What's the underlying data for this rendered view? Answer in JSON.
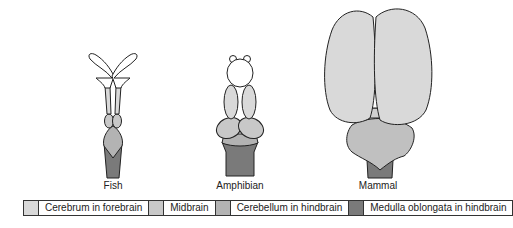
{
  "colors": {
    "cerebrum": "#d9d9d9",
    "midbrain": "#c8c8c8",
    "cerebellum": "#b3b3b3",
    "medulla": "#7a7a7a",
    "outline": "#222222",
    "white_region": "#ffffff"
  },
  "animals": [
    {
      "label": "Fish"
    },
    {
      "label": "Amphibian"
    },
    {
      "label": "Mammal"
    }
  ],
  "legend": [
    {
      "label": "Cerebrum in forebrain",
      "color": "#d9d9d9"
    },
    {
      "label": "Midbrain",
      "color": "#c8c8c8"
    },
    {
      "label": "Cerebellum in hindbrain",
      "color": "#b3b3b3"
    },
    {
      "label": "Medulla oblongata in hindbrain",
      "color": "#7a7a7a"
    }
  ]
}
